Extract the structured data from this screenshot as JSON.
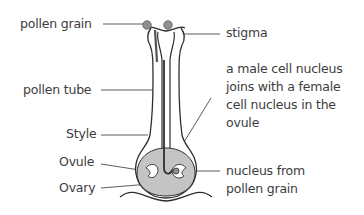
{
  "diagram": {
    "colors": {
      "outline": "#2e2e2e",
      "pollen_grain_fill": "#8f8f8f",
      "ovary_fill": "#c4c4c4",
      "label_text": "#3c3c3c",
      "leader_line": "#4a4a4a"
    },
    "labels_left": [
      {
        "id": "pollen-grain",
        "text": "pollen grain"
      },
      {
        "id": "pollen-tube",
        "text": "pollen tube"
      },
      {
        "id": "style",
        "text": "Style"
      },
      {
        "id": "ovule",
        "text": "Ovule"
      },
      {
        "id": "ovary",
        "text": "Ovary"
      }
    ],
    "labels_right": [
      {
        "id": "stigma",
        "text": "stigma"
      },
      {
        "id": "male-nucleus-joins",
        "lines": [
          "a male cell nucleus",
          "joins with a female",
          "cell nucleus in the",
          "ovule"
        ]
      },
      {
        "id": "nucleus-from-pollen",
        "lines": [
          "nucleus from",
          "pollen grain"
        ]
      }
    ]
  }
}
